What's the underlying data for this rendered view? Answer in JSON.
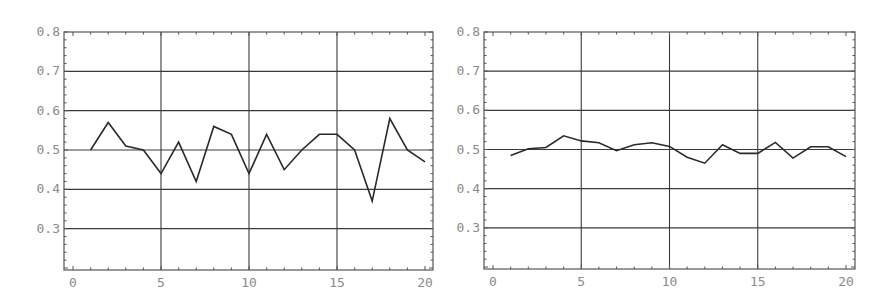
{
  "chart_data": [
    {
      "type": "line",
      "title": "",
      "xlabel": "",
      "ylabel": "",
      "x": [
        1,
        2,
        3,
        4,
        5,
        6,
        7,
        8,
        9,
        10,
        11,
        12,
        13,
        14,
        15,
        16,
        17,
        18,
        19,
        20
      ],
      "series": [
        {
          "name": "series",
          "values": [
            0.5,
            0.57,
            0.51,
            0.5,
            0.44,
            0.52,
            0.42,
            0.56,
            0.54,
            0.44,
            0.54,
            0.45,
            0.5,
            0.54,
            0.54,
            0.5,
            0.37,
            0.58,
            0.5,
            0.47
          ]
        }
      ],
      "xlim": [
        0,
        20
      ],
      "ylim": [
        0.2,
        0.8
      ],
      "xticks": [
        "0",
        "5",
        "10",
        "15",
        "20"
      ],
      "yticks": [
        "0.3",
        "0.4",
        "0.5",
        "0.6",
        "0.7",
        "0.8"
      ],
      "grid": true,
      "legend": null
    },
    {
      "type": "line",
      "title": "",
      "xlabel": "",
      "ylabel": "",
      "x": [
        1,
        2,
        3,
        4,
        5,
        6,
        7,
        8,
        9,
        10,
        11,
        12,
        13,
        14,
        15,
        16,
        17,
        18,
        19,
        20
      ],
      "series": [
        {
          "name": "series",
          "values": [
            0.485,
            0.502,
            0.505,
            0.535,
            0.522,
            0.517,
            0.497,
            0.512,
            0.517,
            0.508,
            0.48,
            0.465,
            0.512,
            0.49,
            0.49,
            0.518,
            0.478,
            0.507,
            0.507,
            0.482
          ]
        }
      ],
      "xlim": [
        0,
        20
      ],
      "ylim": [
        0.2,
        0.8
      ],
      "xticks": [
        "0",
        "5",
        "10",
        "15",
        "20"
      ],
      "yticks": [
        "0.3",
        "0.4",
        "0.5",
        "0.6",
        "0.7",
        "0.8"
      ],
      "grid": true,
      "legend": null
    }
  ],
  "charts": [
    {
      "yticks": [
        "0.3",
        "0.4",
        "0.5",
        "0.6",
        "0.7",
        "0.8"
      ],
      "xticks": [
        "0",
        "5",
        "10",
        "15",
        "20"
      ]
    },
    {
      "yticks": [
        "0.3",
        "0.4",
        "0.5",
        "0.6",
        "0.7",
        "0.8"
      ],
      "xticks": [
        "0",
        "5",
        "10",
        "15",
        "20"
      ]
    }
  ],
  "colors": {
    "line": "#2a2a2a",
    "grid": "#3a3a3a",
    "frame": "#555555",
    "label": "#8a8a8a"
  }
}
